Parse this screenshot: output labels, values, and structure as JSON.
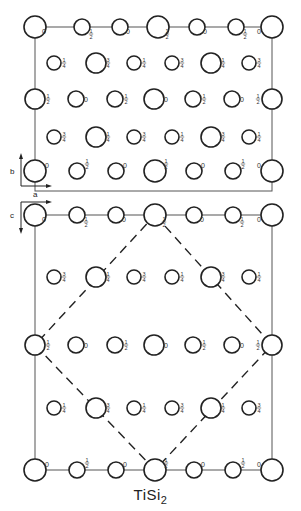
{
  "title": {
    "formula_main": "TiSi",
    "formula_sub": "2"
  },
  "axes": {
    "top_panel": {
      "vertical": "b",
      "horizontal": "a"
    },
    "bottom_panel": {
      "vertical": "c",
      "horizontal": "a"
    }
  },
  "panels": [
    {
      "name": "ab-projection",
      "frame": {
        "x1": 35,
        "y1": 27,
        "x2": 272,
        "y2": 191
      },
      "atoms": [
        {
          "x": 35,
          "y": 27,
          "r": 11,
          "h": "0",
          "lx": 44,
          "ly": 34
        },
        {
          "x": 82,
          "y": 27,
          "r": 8,
          "h": "1/2",
          "lx": 91,
          "ly": 34
        },
        {
          "x": 120,
          "y": 27,
          "r": 8,
          "h": "0",
          "lx": 128,
          "ly": 34
        },
        {
          "x": 158,
          "y": 27,
          "r": 11,
          "h": "1/2",
          "lx": 167,
          "ly": 34
        },
        {
          "x": 197,
          "y": 27,
          "r": 8,
          "h": "0",
          "lx": 205,
          "ly": 34
        },
        {
          "x": 236,
          "y": 27,
          "r": 8,
          "h": "1/2",
          "lx": 245,
          "ly": 34
        },
        {
          "x": 272,
          "y": 27,
          "r": 11,
          "h": "0",
          "lx": 259,
          "ly": 34
        },
        {
          "x": 54,
          "y": 63,
          "r": 7,
          "h": "1/4",
          "lx": 64,
          "ly": 63
        },
        {
          "x": 96,
          "y": 63,
          "r": 10,
          "h": "3/4",
          "lx": 108,
          "ly": 63
        },
        {
          "x": 134,
          "y": 63,
          "r": 7,
          "h": "1/4",
          "lx": 144,
          "ly": 63
        },
        {
          "x": 172,
          "y": 63,
          "r": 7,
          "h": "3/4",
          "lx": 182,
          "ly": 63
        },
        {
          "x": 211,
          "y": 63,
          "r": 10,
          "h": "1/4",
          "lx": 223,
          "ly": 63
        },
        {
          "x": 249,
          "y": 63,
          "r": 7,
          "h": "3/4",
          "lx": 259,
          "ly": 63
        },
        {
          "x": 35,
          "y": 99,
          "r": 10,
          "h": "1/2",
          "lx": 48,
          "ly": 99
        },
        {
          "x": 76,
          "y": 99,
          "r": 8,
          "h": "0",
          "lx": 86,
          "ly": 102
        },
        {
          "x": 115,
          "y": 99,
          "r": 8,
          "h": "1/2",
          "lx": 126,
          "ly": 99
        },
        {
          "x": 154,
          "y": 99,
          "r": 10,
          "h": "0",
          "lx": 166,
          "ly": 102
        },
        {
          "x": 193,
          "y": 99,
          "r": 8,
          "h": "1/2",
          "lx": 204,
          "ly": 99
        },
        {
          "x": 232,
          "y": 99,
          "r": 8,
          "h": "0",
          "lx": 242,
          "ly": 102
        },
        {
          "x": 272,
          "y": 99,
          "r": 10,
          "h": "1/2",
          "lx": 258,
          "ly": 99
        },
        {
          "x": 54,
          "y": 137,
          "r": 7,
          "h": "3/4",
          "lx": 64,
          "ly": 137
        },
        {
          "x": 96,
          "y": 137,
          "r": 10,
          "h": "1/4",
          "lx": 108,
          "ly": 137
        },
        {
          "x": 134,
          "y": 137,
          "r": 7,
          "h": "3/4",
          "lx": 144,
          "ly": 137
        },
        {
          "x": 172,
          "y": 137,
          "r": 7,
          "h": "1/4",
          "lx": 182,
          "ly": 137
        },
        {
          "x": 211,
          "y": 137,
          "r": 10,
          "h": "3/4",
          "lx": 223,
          "ly": 137
        },
        {
          "x": 249,
          "y": 137,
          "r": 7,
          "h": "1/4",
          "lx": 259,
          "ly": 137
        },
        {
          "x": 35,
          "y": 171,
          "r": 11,
          "h": "0",
          "lx": 47,
          "ly": 168
        },
        {
          "x": 77,
          "y": 171,
          "r": 8,
          "h": "1/2",
          "lx": 87,
          "ly": 164
        },
        {
          "x": 116,
          "y": 171,
          "r": 8,
          "h": "0",
          "lx": 125,
          "ly": 168
        },
        {
          "x": 155,
          "y": 171,
          "r": 11,
          "h": "1/2",
          "lx": 166,
          "ly": 164
        },
        {
          "x": 194,
          "y": 171,
          "r": 8,
          "h": "0",
          "lx": 203,
          "ly": 168
        },
        {
          "x": 233,
          "y": 171,
          "r": 8,
          "h": "1/2",
          "lx": 243,
          "ly": 164
        },
        {
          "x": 272,
          "y": 171,
          "r": 11,
          "h": "0",
          "lx": 259,
          "ly": 168
        }
      ]
    },
    {
      "name": "ac-projection",
      "frame": {
        "x1": 35,
        "y1": 215,
        "x2": 272,
        "y2": 470
      },
      "diamond": [
        [
          155,
          215
        ],
        [
          272,
          345
        ],
        [
          155,
          470
        ],
        [
          35,
          345
        ]
      ],
      "atoms": [
        {
          "x": 35,
          "y": 215,
          "r": 11,
          "h": "0",
          "lx": 44,
          "ly": 222
        },
        {
          "x": 77,
          "y": 215,
          "r": 8,
          "h": "1/2",
          "lx": 86,
          "ly": 222
        },
        {
          "x": 116,
          "y": 215,
          "r": 8,
          "h": "0",
          "lx": 124,
          "ly": 222
        },
        {
          "x": 155,
          "y": 215,
          "r": 11,
          "h": "1/2",
          "lx": 164,
          "ly": 222
        },
        {
          "x": 194,
          "y": 215,
          "r": 8,
          "h": "0",
          "lx": 202,
          "ly": 222
        },
        {
          "x": 233,
          "y": 215,
          "r": 8,
          "h": "1/2",
          "lx": 242,
          "ly": 222
        },
        {
          "x": 272,
          "y": 215,
          "r": 11,
          "h": "0",
          "lx": 259,
          "ly": 222
        },
        {
          "x": 54,
          "y": 277,
          "r": 7,
          "h": "3/4",
          "lx": 64,
          "ly": 277
        },
        {
          "x": 96,
          "y": 277,
          "r": 10,
          "h": "1/4",
          "lx": 108,
          "ly": 277
        },
        {
          "x": 134,
          "y": 277,
          "r": 7,
          "h": "3/4",
          "lx": 144,
          "ly": 277
        },
        {
          "x": 172,
          "y": 277,
          "r": 7,
          "h": "1/4",
          "lx": 182,
          "ly": 277
        },
        {
          "x": 211,
          "y": 277,
          "r": 10,
          "h": "3/4",
          "lx": 223,
          "ly": 277
        },
        {
          "x": 249,
          "y": 277,
          "r": 7,
          "h": "1/4",
          "lx": 259,
          "ly": 277
        },
        {
          "x": 35,
          "y": 345,
          "r": 10,
          "h": "1/2",
          "lx": 48,
          "ly": 345
        },
        {
          "x": 76,
          "y": 345,
          "r": 8,
          "h": "0",
          "lx": 86,
          "ly": 348
        },
        {
          "x": 115,
          "y": 345,
          "r": 8,
          "h": "1/2",
          "lx": 126,
          "ly": 345
        },
        {
          "x": 154,
          "y": 345,
          "r": 10,
          "h": "0",
          "lx": 166,
          "ly": 348
        },
        {
          "x": 193,
          "y": 345,
          "r": 8,
          "h": "1/2",
          "lx": 204,
          "ly": 345
        },
        {
          "x": 232,
          "y": 345,
          "r": 8,
          "h": "0",
          "lx": 242,
          "ly": 348
        },
        {
          "x": 272,
          "y": 345,
          "r": 10,
          "h": "1/2",
          "lx": 258,
          "ly": 345
        },
        {
          "x": 54,
          "y": 408,
          "r": 7,
          "h": "1/4",
          "lx": 64,
          "ly": 408
        },
        {
          "x": 96,
          "y": 408,
          "r": 10,
          "h": "3/4",
          "lx": 108,
          "ly": 408
        },
        {
          "x": 134,
          "y": 408,
          "r": 7,
          "h": "1/4",
          "lx": 144,
          "ly": 408
        },
        {
          "x": 172,
          "y": 408,
          "r": 7,
          "h": "3/4",
          "lx": 182,
          "ly": 408
        },
        {
          "x": 211,
          "y": 408,
          "r": 10,
          "h": "1/4",
          "lx": 223,
          "ly": 408
        },
        {
          "x": 249,
          "y": 408,
          "r": 7,
          "h": "3/4",
          "lx": 259,
          "ly": 408
        },
        {
          "x": 35,
          "y": 470,
          "r": 11,
          "h": "0",
          "lx": 47,
          "ly": 467
        },
        {
          "x": 77,
          "y": 470,
          "r": 8,
          "h": "1/2",
          "lx": 87,
          "ly": 463
        },
        {
          "x": 116,
          "y": 470,
          "r": 8,
          "h": "0",
          "lx": 125,
          "ly": 467
        },
        {
          "x": 155,
          "y": 470,
          "r": 11,
          "h": "1/2",
          "lx": 166,
          "ly": 463
        },
        {
          "x": 194,
          "y": 470,
          "r": 8,
          "h": "0",
          "lx": 203,
          "ly": 467
        },
        {
          "x": 233,
          "y": 470,
          "r": 8,
          "h": "1/2",
          "lx": 243,
          "ly": 463
        },
        {
          "x": 272,
          "y": 470,
          "r": 11,
          "h": "0",
          "lx": 259,
          "ly": 467
        }
      ]
    }
  ]
}
